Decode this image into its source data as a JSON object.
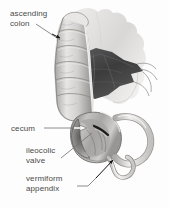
{
  "figure": {
    "width": 169,
    "height": 208,
    "background_color": "#fdfdfd",
    "label_color": "#4a4a4a",
    "style": "grayscale medical illustration"
  },
  "labels": {
    "ascending_colon": {
      "line1": "ascending",
      "line2": "colon"
    },
    "cecum": {
      "text": "cecum"
    },
    "ileocolic_valve": {
      "line1": "ileocolic",
      "line2": "valve"
    },
    "vermiform_appendix": {
      "line1": "vermiform",
      "line2": "appendix"
    }
  },
  "structures": [
    "ascending colon with haustra",
    "mesentery",
    "ileum",
    "cecum cut open",
    "ileocolic valve",
    "vermiform appendix"
  ],
  "colors": {
    "tissue_light": "#e4e2e0",
    "tissue_mid": "#b9b7b5",
    "tissue_dark": "#8e8c8a",
    "mesentery_dark": "#474747",
    "outline": "#6b6b6b",
    "leader_line": "#6e6e6e",
    "arrow_black": "#1a1a1a",
    "arrow_white": "#ffffff"
  }
}
